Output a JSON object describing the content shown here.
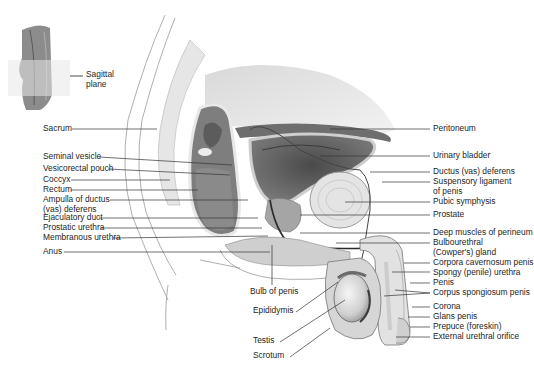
{
  "figure": {
    "inset": {
      "label": "Sagittal\nplane",
      "line1": "Sagittal",
      "line2": "plane"
    },
    "left_labels": [
      {
        "id": "sacrum",
        "text": "Sacrum",
        "y": 129
      },
      {
        "id": "seminal-vesicle",
        "text": "Seminal vesicle",
        "y": 157
      },
      {
        "id": "vesicorectal-pouch",
        "text": "Vesicorectal pouch",
        "y": 169
      },
      {
        "id": "coccyx",
        "text": "Coccyx",
        "y": 180
      },
      {
        "id": "rectum",
        "text": "Rectum",
        "y": 190
      },
      {
        "id": "ampulla",
        "text": "Ampulla of ductus",
        "text2": "(vas) deferens",
        "y": 200
      },
      {
        "id": "ejaculatory-duct",
        "text": "Ejaculatory duct",
        "y": 218
      },
      {
        "id": "prostatic-urethra",
        "text": "Prostatic urethra",
        "y": 228
      },
      {
        "id": "membranous-urethra",
        "text": "Membranous urethra",
        "y": 238
      },
      {
        "id": "anus",
        "text": "Anus",
        "y": 252
      }
    ],
    "right_labels": [
      {
        "id": "peritoneum",
        "text": "Peritoneum",
        "y": 129
      },
      {
        "id": "urinary-bladder",
        "text": "Urinary bladder",
        "y": 156
      },
      {
        "id": "ductus-deferens",
        "text": "Ductus (vas) deferens",
        "y": 172
      },
      {
        "id": "suspensory-ligament",
        "text": "Suspensory ligament",
        "text2": "of penis",
        "y": 182
      },
      {
        "id": "pubic-symphysis",
        "text": "Pubic symphysis",
        "y": 202
      },
      {
        "id": "prostate",
        "text": "Prostate",
        "y": 215
      },
      {
        "id": "deep-muscles",
        "text": "Deep muscles of perineum",
        "y": 233
      },
      {
        "id": "bulbourethral",
        "text": "Bulbourethral",
        "text2": "(Cowper's) gland",
        "y": 243
      },
      {
        "id": "corpora-cavernosum",
        "text": "Corpora cavernosum penis",
        "y": 263
      },
      {
        "id": "spongy-urethra",
        "text": "Spongy (penile) urethra",
        "y": 273
      },
      {
        "id": "penis",
        "text": "Penis",
        "y": 283
      },
      {
        "id": "corpus-spongiosum",
        "text": "Corpus spongiosum penis",
        "y": 293
      },
      {
        "id": "corona",
        "text": "Corona",
        "y": 307
      },
      {
        "id": "glans-penis",
        "text": "Glans penis",
        "y": 317
      },
      {
        "id": "prepuce",
        "text": "Prepuce (foreskin)",
        "y": 327
      },
      {
        "id": "external-urethral-orifice",
        "text": "External urethral orifice",
        "y": 337
      }
    ],
    "bottom_labels": [
      {
        "id": "bulb-of-penis",
        "text": "Bulb of penis",
        "x": 250,
        "y": 291
      },
      {
        "id": "epididymis",
        "text": "Epididymis",
        "x": 253,
        "y": 310
      },
      {
        "id": "testis",
        "text": "Testis",
        "x": 253,
        "y": 340
      },
      {
        "id": "scrotum",
        "text": "Scrotum",
        "x": 253,
        "y": 355
      }
    ]
  }
}
